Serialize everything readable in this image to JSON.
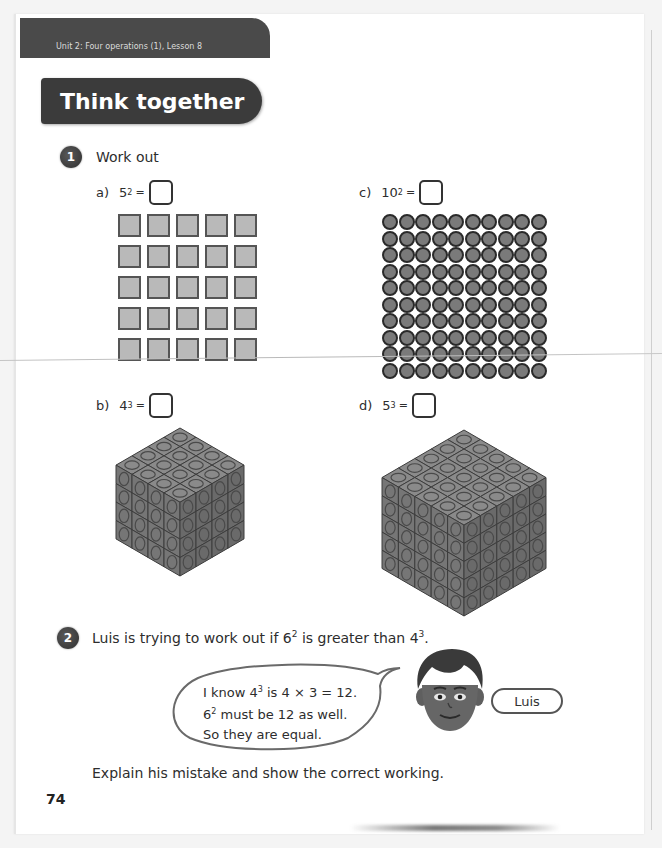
{
  "header": {
    "unit_label": "Unit 2: Four operations (1), Lesson 8",
    "section_title": "Think together"
  },
  "question1": {
    "number": "1",
    "prompt": "Work out",
    "parts": [
      {
        "letter": "a)",
        "base": "5",
        "exponent": "2",
        "equals": "=",
        "answer": "",
        "visual": "5x5 grid of squares",
        "rows": 5,
        "cols": 5
      },
      {
        "letter": "b)",
        "base": "4",
        "exponent": "3",
        "equals": "=",
        "answer": "",
        "visual": "4x4x4 cube of linking cubes",
        "size": 4
      },
      {
        "letter": "c)",
        "base": "10",
        "exponent": "2",
        "equals": "=",
        "answer": "",
        "visual": "10x10 grid of counters",
        "rows": 10,
        "cols": 10
      },
      {
        "letter": "d)",
        "base": "5",
        "exponent": "3",
        "equals": "=",
        "answer": "",
        "visual": "5x5x5 cube of linking cubes",
        "size": 5
      }
    ]
  },
  "question2": {
    "number": "2",
    "prompt_pre": "Luis is trying to work out if ",
    "prompt_a_base": "6",
    "prompt_a_exp": "2",
    "prompt_mid": " is greater than ",
    "prompt_b_base": "4",
    "prompt_b_exp": "3",
    "prompt_post": ".",
    "speech": {
      "line1_pre": "I know ",
      "line1_base": "4",
      "line1_exp": "3",
      "line1_post": " is 4 × 3 = 12.",
      "line2_base": "6",
      "line2_exp": "2",
      "line2_post": " must be 12 as well.",
      "line3": "So they are equal."
    },
    "character_name": "Luis",
    "instruction": "Explain his mistake and show the correct working."
  },
  "footer": {
    "page_number": "74"
  },
  "colors": {
    "band": "#4a4a4a",
    "title_pill": "#3b3b3b",
    "square_fill": "#b9b9b9",
    "counter_fill": "#7a7a7a",
    "cube_fill": "#808080"
  }
}
